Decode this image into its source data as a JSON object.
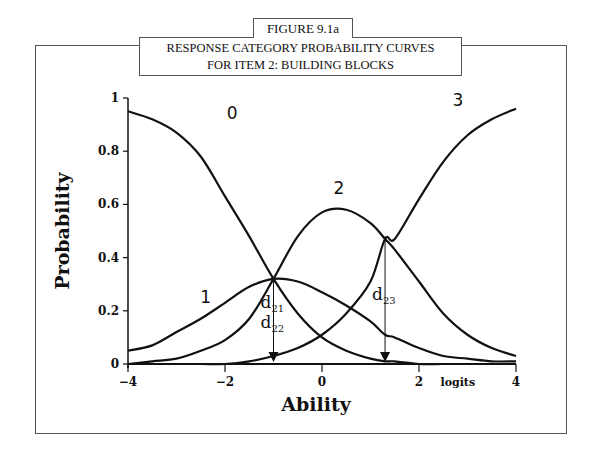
{
  "figure": {
    "number_label": "FIGURE 9.1a",
    "title_line1": "RESPONSE CATEGORY PROBABILITY CURVES",
    "title_line2": "FOR ITEM 2: BUILDING BLOCKS"
  },
  "chart_data": {
    "type": "line",
    "title": "RESPONSE CATEGORY PROBABILITY CURVES FOR ITEM 2: BUILDING BLOCKS",
    "xlabel": "Ability",
    "x_unit_label": "logits",
    "ylabel": "Probability",
    "xlim": [
      -4,
      4
    ],
    "ylim": [
      0,
      1
    ],
    "x_ticks": [
      -4,
      -2,
      0,
      2,
      4
    ],
    "x_tick_labels": [
      "−4",
      "−2",
      "0",
      "2",
      "4"
    ],
    "y_ticks": [
      0,
      0.2,
      0.4,
      0.6,
      0.8,
      1
    ],
    "y_tick_labels": [
      "0",
      "0.2",
      "0.4",
      "0.6",
      "0.8",
      "1"
    ],
    "grid": false,
    "legend": "none (curves labeled inline)",
    "x": [
      -4,
      -3.5,
      -3,
      -2.5,
      -2,
      -1.5,
      -1,
      -0.5,
      0,
      0.5,
      1,
      1.3,
      1.5,
      2,
      2.5,
      3,
      3.5,
      4
    ],
    "series": [
      {
        "name": "0",
        "values": [
          0.95,
          0.92,
          0.87,
          0.78,
          0.63,
          0.48,
          0.32,
          0.19,
          0.1,
          0.05,
          0.02,
          0.01,
          0.01,
          0.0,
          0.0,
          0.0,
          0.0,
          0.0
        ]
      },
      {
        "name": "1",
        "values": [
          0.05,
          0.07,
          0.12,
          0.17,
          0.23,
          0.29,
          0.32,
          0.31,
          0.27,
          0.22,
          0.16,
          0.11,
          0.1,
          0.06,
          0.03,
          0.02,
          0.01,
          0.01
        ]
      },
      {
        "name": "2",
        "values": [
          0.0,
          0.01,
          0.02,
          0.05,
          0.09,
          0.17,
          0.32,
          0.48,
          0.57,
          0.58,
          0.53,
          0.47,
          0.43,
          0.31,
          0.19,
          0.11,
          0.06,
          0.03
        ]
      },
      {
        "name": "3",
        "values": [
          0.0,
          0.0,
          0.0,
          0.0,
          0.0,
          0.01,
          0.03,
          0.06,
          0.11,
          0.19,
          0.31,
          0.47,
          0.47,
          0.62,
          0.76,
          0.86,
          0.92,
          0.96
        ]
      }
    ],
    "annotations": [
      {
        "label": "d21",
        "text_main": "d",
        "text_sub": "21",
        "x": -1.0,
        "y": 0.32
      },
      {
        "label": "d22",
        "text_main": "d",
        "text_sub": "22",
        "x": -1.0,
        "y": 0.32
      },
      {
        "label": "d23",
        "text_main": "d",
        "text_sub": "23",
        "x": 1.3,
        "y": 0.48
      }
    ],
    "curve_labels": [
      {
        "text": "0",
        "x": -1.85,
        "y": 0.92
      },
      {
        "text": "1",
        "x": -2.4,
        "y": 0.23
      },
      {
        "text": "2",
        "x": 0.35,
        "y": 0.64
      },
      {
        "text": "3",
        "x": 2.8,
        "y": 0.97
      }
    ]
  }
}
